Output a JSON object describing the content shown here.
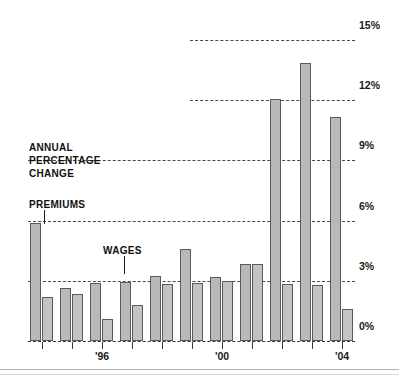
{
  "chart_data": {
    "type": "bar",
    "title": "",
    "subtitle": "",
    "xlabel": "",
    "ylabel": "ANNUAL PERCENTAGE CHANGE",
    "ylim": [
      0,
      15
    ],
    "ytick_labels": [
      "15%",
      "12%",
      "9%",
      "6%",
      "3%",
      "0%"
    ],
    "ytick_values": [
      15,
      12,
      9,
      6,
      3,
      0
    ],
    "grid": true,
    "legend_position": "inline-annotation",
    "categories": [
      "1994",
      "1995",
      "1996",
      "1997",
      "1998",
      "1999",
      "2000",
      "2001",
      "2002",
      "2003",
      "2004"
    ],
    "xtick_labels": [
      "",
      "",
      "'96",
      "",
      "",
      "",
      "'00",
      "",
      "",
      "",
      "'04"
    ],
    "series": [
      {
        "name": "PREMIUMS",
        "values": [
          5.9,
          2.65,
          2.9,
          2.95,
          3.25,
          4.6,
          3.2,
          3.85,
          12.1,
          13.9,
          11.2
        ]
      },
      {
        "name": "WAGES",
        "values": [
          2.2,
          2.35,
          1.1,
          1.8,
          2.85,
          2.9,
          3.0,
          3.85,
          2.85,
          2.8,
          1.6
        ]
      }
    ],
    "annotations": [
      {
        "text": "ANNUAL\nPERCENTAGE\nCHANGE",
        "name": "axis-title"
      },
      {
        "text": "PREMIUMS",
        "name": "premiums-callout"
      },
      {
        "text": "WAGES",
        "name": "wages-callout"
      }
    ]
  },
  "axis": {
    "y_labels": [
      "15%",
      "12%",
      "9%",
      "6%",
      "3%",
      "0%"
    ],
    "x_labels": [
      "'96",
      "'00",
      "'04"
    ]
  },
  "annotations": {
    "axis_title_line1": "ANNUAL",
    "axis_title_line2": "PERCENTAGE",
    "axis_title_line3": "CHANGE",
    "premiums_label": "PREMIUMS",
    "wages_label": "WAGES"
  },
  "colors": {
    "bar_fill": "#b9b9b9",
    "bar_stroke": "#5a5a5a",
    "grid": "#4a4a4a",
    "text": "#111111"
  }
}
